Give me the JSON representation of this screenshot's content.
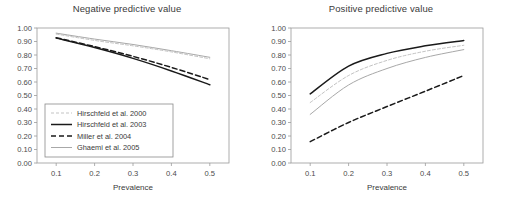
{
  "figure": {
    "panels": [
      "negative_predictive_value",
      "positive_predictive_value"
    ]
  },
  "chart_data": [
    {
      "type": "line",
      "title": "Negative predictive value",
      "xlabel": "Prevalence",
      "ylabel": "",
      "xlim": [
        0.05,
        0.55
      ],
      "ylim": [
        0.0,
        1.0
      ],
      "grid": false,
      "legend_position": "lower-left",
      "xticks": [
        "0.1",
        "0.2",
        "0.3",
        "0.4",
        "0.5"
      ],
      "xtick_values": [
        0.1,
        0.2,
        0.3,
        0.4,
        0.5
      ],
      "yticks": [
        "0.00",
        "0.10",
        "0.20",
        "0.30",
        "0.40",
        "0.50",
        "0.60",
        "0.70",
        "0.80",
        "0.90",
        "1.00"
      ],
      "ytick_values": [
        0.0,
        0.1,
        0.2,
        0.3,
        0.4,
        0.5,
        0.6,
        0.7,
        0.8,
        0.9,
        1.0
      ],
      "x": [
        0.1,
        0.2,
        0.3,
        0.4,
        0.5
      ],
      "series": [
        {
          "name": "Hirschfeld et al. 2000",
          "style": "fine-dashed",
          "color": "#b4b4b4",
          "width": 0.8,
          "dasharray": "3,2",
          "values": [
            0.955,
            0.908,
            0.868,
            0.823,
            0.772
          ]
        },
        {
          "name": "Hirschfeld et al. 2003",
          "style": "solid",
          "color": "#1a1a1a",
          "width": 1.5,
          "dasharray": "none",
          "values": [
            0.925,
            0.855,
            0.775,
            0.682,
            0.58
          ]
        },
        {
          "name": "Miller et al. 2004",
          "style": "bold-dashed",
          "color": "#1a1a1a",
          "width": 1.5,
          "dasharray": "5,3",
          "values": [
            0.928,
            0.862,
            0.79,
            0.708,
            0.618
          ]
        },
        {
          "name": "Ghaemi et al. 2005",
          "style": "solid",
          "color": "#a8a8a8",
          "width": 1.0,
          "dasharray": "none",
          "values": [
            0.962,
            0.918,
            0.878,
            0.832,
            0.783
          ]
        }
      ]
    },
    {
      "type": "line",
      "title": "Positive predictive value",
      "xlabel": "Prevalence",
      "ylabel": "",
      "xlim": [
        0.05,
        0.55
      ],
      "ylim": [
        0.0,
        1.0
      ],
      "grid": false,
      "legend_position": "none",
      "xticks": [
        "0.1",
        "0.2",
        "0.3",
        "0.4",
        "0.5"
      ],
      "xtick_values": [
        0.1,
        0.2,
        0.3,
        0.4,
        0.5
      ],
      "yticks": [
        "0.00",
        "0.10",
        "0.20",
        "0.30",
        "0.40",
        "0.50",
        "0.60",
        "0.70",
        "0.80",
        "0.90",
        "1.00"
      ],
      "ytick_values": [
        0.0,
        0.1,
        0.2,
        0.3,
        0.4,
        0.5,
        0.6,
        0.7,
        0.8,
        0.9,
        1.0
      ],
      "x": [
        0.1,
        0.2,
        0.3,
        0.4,
        0.5
      ],
      "series": [
        {
          "name": "Hirschfeld et al. 2000",
          "style": "fine-dashed",
          "color": "#b4b4b4",
          "width": 0.8,
          "dasharray": "3,2",
          "values": [
            0.448,
            0.648,
            0.76,
            0.828,
            0.872
          ]
        },
        {
          "name": "Hirschfeld et al. 2003",
          "style": "solid",
          "color": "#1a1a1a",
          "width": 1.5,
          "dasharray": "none",
          "values": [
            0.512,
            0.718,
            0.812,
            0.868,
            0.908
          ]
        },
        {
          "name": "Miller et al. 2004",
          "style": "bold-dashed",
          "color": "#1a1a1a",
          "width": 1.5,
          "dasharray": "5,3",
          "values": [
            0.158,
            0.3,
            0.418,
            0.532,
            0.648
          ]
        },
        {
          "name": "Ghaemi et al. 2005",
          "style": "solid",
          "color": "#a8a8a8",
          "width": 1.0,
          "dasharray": "none",
          "values": [
            0.36,
            0.578,
            0.7,
            0.782,
            0.84
          ]
        }
      ]
    }
  ]
}
